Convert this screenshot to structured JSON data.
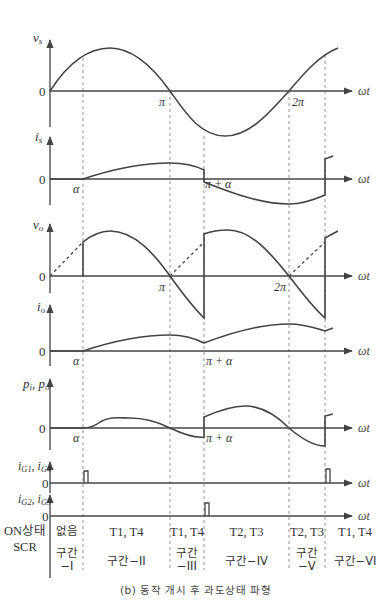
{
  "figure": {
    "caption": "(b) 동작 개시 후 과도상태 파형",
    "x_axis_label": "ωt",
    "zero_label": "0",
    "angle_markers": {
      "alpha": "α",
      "pi": "π",
      "pi_plus_alpha": "π + α",
      "two_pi": "2π"
    },
    "plots": [
      {
        "id": "vs",
        "label": "v",
        "sub": "s",
        "ticks": [
          "π",
          "2π"
        ]
      },
      {
        "id": "is",
        "label": "i",
        "sub": "s",
        "ticks": [
          "α",
          "π + α"
        ]
      },
      {
        "id": "vo",
        "label": "v",
        "sub": "o",
        "ticks": [
          "π",
          "2π"
        ]
      },
      {
        "id": "io",
        "label": "i",
        "sub": "o",
        "ticks": [
          "α",
          "π + α"
        ]
      },
      {
        "id": "p",
        "label": "p",
        "sub": "i",
        "label2": "p",
        "sub2": "o",
        "ticks": [
          "α",
          "π + α"
        ]
      },
      {
        "id": "ig14",
        "label": "i",
        "sub": "G1",
        "label2": "i",
        "sub2": "G4"
      },
      {
        "id": "ig23",
        "label": "i",
        "sub": "G2",
        "label2": "i",
        "sub2": "G3"
      }
    ],
    "table": {
      "row_header_line1": "ON상태",
      "row_header_line2": "SCR",
      "intervals": [
        {
          "scr": "없음",
          "name_line1": "구간",
          "name_line2": "−I"
        },
        {
          "scr": "T1, T4",
          "name_line1": "구간−II",
          "name_line2": ""
        },
        {
          "scr": "T1, T4",
          "name_line1": "구간",
          "name_line2": "−III"
        },
        {
          "scr": "T2, T3",
          "name_line1": "구간−IV",
          "name_line2": ""
        },
        {
          "scr": "T2, T3",
          "name_line1": "구간",
          "name_line2": "−V"
        },
        {
          "scr": "T1, T4",
          "name_line1": "구간−VI",
          "name_line2": ""
        }
      ]
    },
    "colors": {
      "waveform": "#444444",
      "axis": "#444444",
      "guide": "#888888"
    }
  }
}
